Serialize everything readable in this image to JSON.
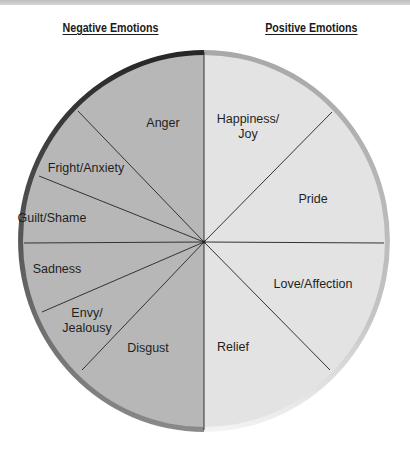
{
  "headers": {
    "negative": "Negative Emotions",
    "positive": "Positive Emotions"
  },
  "colors": {
    "negative_fill": "#b7b7b7",
    "positive_fill": "#e3e3e3",
    "negative_rim_top": "#262626",
    "negative_rim_bottom": "#7a7a7a",
    "positive_rim": "#b3b3b3",
    "divider": "#333333"
  },
  "segments": {
    "negative": [
      {
        "label": "Anger",
        "lines": [
          "Anger"
        ]
      },
      {
        "label": "Fright/Anxiety",
        "lines": [
          "Fright/Anxiety"
        ]
      },
      {
        "label": "Guilt/Shame",
        "lines": [
          "Guilt/Shame"
        ]
      },
      {
        "label": "Sadness",
        "lines": [
          "Sadness"
        ]
      },
      {
        "label": "Envy/Jealousy",
        "lines": [
          "Envy/",
          "Jealousy"
        ]
      },
      {
        "label": "Disgust",
        "lines": [
          "Disgust"
        ]
      }
    ],
    "positive": [
      {
        "label": "Happiness/Joy",
        "lines": [
          "Happiness/",
          "Joy"
        ]
      },
      {
        "label": "Pride",
        "lines": [
          "Pride"
        ]
      },
      {
        "label": "Love/Affection",
        "lines": [
          "Love/Affection"
        ]
      },
      {
        "label": "Relief",
        "lines": [
          "Relief"
        ]
      }
    ]
  }
}
